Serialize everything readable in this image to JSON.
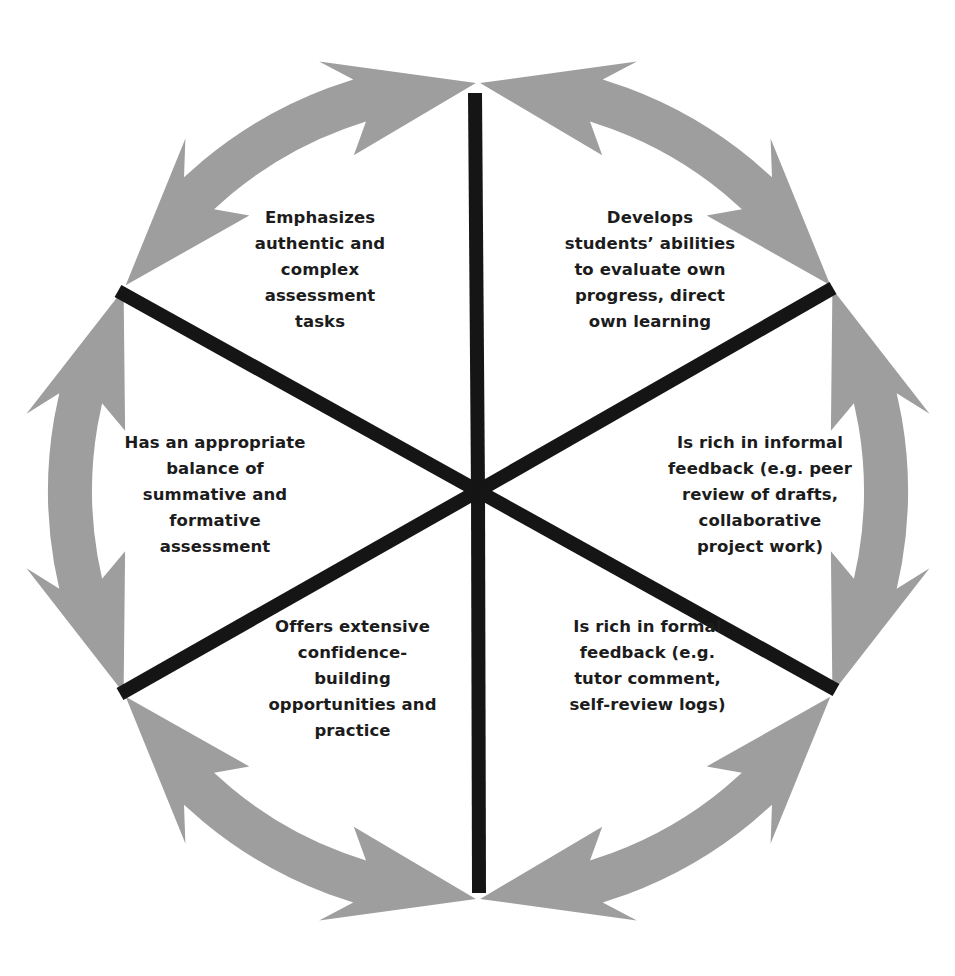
{
  "diagram": {
    "type": "cyclic-wheel",
    "center": {
      "x": 478,
      "y": 491
    },
    "ring": {
      "radius": 408,
      "thickness": 44,
      "color": "#9e9e9e",
      "segments": 6,
      "arrows": "double-headed, each segment points into both adjacent junctions"
    },
    "spokes": {
      "color": "#151515",
      "count": 6,
      "endpoints": [
        {
          "x": 475,
          "y": 93
        },
        {
          "x": 833,
          "y": 288
        },
        {
          "x": 836,
          "y": 690
        },
        {
          "x": 479,
          "y": 893
        },
        {
          "x": 120,
          "y": 694
        },
        {
          "x": 118,
          "y": 291
        }
      ]
    },
    "sectors": [
      {
        "id": "top-left",
        "lines": [
          "Emphasizes",
          "authentic and",
          "complex",
          "assessment",
          "tasks"
        ]
      },
      {
        "id": "top-right",
        "lines": [
          "Develops",
          "students’ abilities",
          "to evaluate own",
          "progress, direct",
          "own learning"
        ]
      },
      {
        "id": "right",
        "lines": [
          "Is rich in informal",
          "feedback (e.g. peer",
          "review of drafts,",
          "collaborative",
          "project work)"
        ]
      },
      {
        "id": "bottom-right",
        "lines": [
          "Is rich in formal",
          "feedback (e.g.",
          "tutor comment,",
          "self-review logs)"
        ]
      },
      {
        "id": "bottom-left",
        "lines": [
          "Offers extensive",
          "confidence-",
          "building",
          "opportunities and",
          "practice"
        ]
      },
      {
        "id": "left",
        "lines": [
          "Has an appropriate",
          "balance of",
          "summative and",
          "formative",
          "assessment"
        ]
      }
    ]
  }
}
